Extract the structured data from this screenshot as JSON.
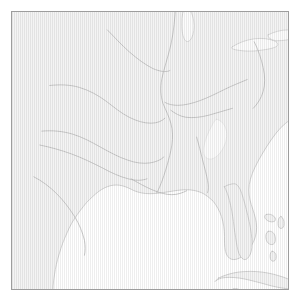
{
  "figure": {
    "kind": "reference-outline-map",
    "title": "",
    "width_px": 301,
    "height_px": 302,
    "frame": {
      "border_color": "#9d9d9d",
      "border_width_px": 1,
      "inset_left_px": 11,
      "inset_top_px": 11,
      "inner_width_px": 278,
      "inner_height_px": 279
    }
  },
  "palette": {
    "page_background": "#ffffff",
    "land_fill": "#f4f4f4",
    "land_hatch": "#969696",
    "water_fill": "#ffffff",
    "coastline_stroke": "#c9c9c9",
    "river_stroke": "#b9b9b9",
    "lake_fill": "#fcfcfc",
    "lake_stroke": "#cccccc",
    "border_stroke": "#9d9d9d"
  },
  "legend": {
    "visible": false,
    "entries": []
  },
  "axes": {
    "visible": false,
    "tick_labels": []
  },
  "labels": {
    "visible": false,
    "items": []
  },
  "map_features": {
    "region_described": "Gulf of Mexico and southeastern United States",
    "land_masses": [
      {
        "name": "north-american-mainland",
        "kind": "land",
        "fill": "#f4f4f4",
        "stroke": "#c9c9c9",
        "path": "M -10,-10 L 288,-10 L 288,104 C 280,108 272,114 266,122 C 259,131 253,141 248,150 C 243,159 240,167 239,174 C 238,181 239,188 241,194 C 243,200 245,206 246,212 C 247,219 246,226 243,232 C 240,238 236,243 232,246 C 228,249 224,250 221,249 C 218,248 216,245 215,241 C 214,236 214,231 214,226 C 214,219 213,212 211,206 C 209,200 206,195 203,191 C 199,187 195,184 191,182 C 186,180 181,179 176,179 C 170,179 164,180 158,181 C 151,182 145,183 139,183 C 133,183 128,182 123,180 C 119,178 115,176 111,175 C 107,174 103,174 99,175 C 95,176 91,178 87,181 C 83,184 79,188 75,192 C 71,197 67,202 63,208 C 59,214 56,221 53,228 C 50,235 48,242 46,249 C 44,256 43,263 42,270 C 41,278 41,286 41,294 L -10,294 Z"
      },
      {
        "name": "florida-peninsula",
        "kind": "land",
        "fill": "#f4f4f4",
        "stroke": "#c9c9c9",
        "path": "M 214,176 C 216,180 218,185 219,190 C 221,197 222,204 223,211 C 224,219 225,226 226,232 C 227,238 228,243 230,246 C 232,249 234,250 236,249 C 238,248 240,245 241,241 C 242,236 242,230 241,223 C 240,215 238,207 236,199 C 234,191 232,184 230,179 C 228,175 226,173 224,173 C 221,173 217,174 214,176 Z"
      },
      {
        "name": "cuba",
        "kind": "land",
        "fill": "#f4f4f4",
        "stroke": "#c9c9c9",
        "path": "M 208,268 C 214,265 221,263 228,262 C 236,261 244,261 252,262 C 260,263 267,265 273,267 C 279,269 283,271 286,273 C 288,275 288,277 286,278 C 283,279 278,279 272,278 C 265,277 258,275 251,273 C 243,271 236,269 229,268 C 222,267 216,267 211,268 C 208,269 206,270 205,271 C 204,272 205,271 208,268 Z"
      },
      {
        "name": "yucatan-peninsula",
        "kind": "land",
        "fill": "#f4f4f4",
        "stroke": "#c9c9c9",
        "path": "M 148,288 C 153,284 159,282 165,281 C 172,280 179,280 185,281 C 190,282 194,284 196,286 L 198,294 L 146,294 Z"
      },
      {
        "name": "bahamas-island-1",
        "kind": "land",
        "fill": "#f4f4f4",
        "stroke": "#c9c9c9",
        "path": "M 256,204 C 259,203 262,204 264,206 C 266,208 266,210 264,211 C 261,212 258,211 256,209 C 254,207 254,205 256,204 Z"
      },
      {
        "name": "bahamas-island-2",
        "kind": "land",
        "fill": "#f4f4f4",
        "stroke": "#c9c9c9",
        "path": "M 271,206 C 273,207 274,210 274,213 C 274,216 273,218 271,218 C 269,218 268,216 268,213 C 268,209 269,206 271,206 Z"
      },
      {
        "name": "bahamas-island-3",
        "kind": "land",
        "fill": "#f4f4f4",
        "stroke": "#c9c9c9",
        "path": "M 258,221 C 261,220 264,222 265,226 C 266,230 265,233 263,234 C 260,235 257,233 256,229 C 255,225 256,222 258,221 Z"
      },
      {
        "name": "bahamas-island-4",
        "kind": "land",
        "fill": "#f4f4f4",
        "stroke": "#c9c9c9",
        "path": "M 262,241 C 264,241 266,243 266,246 C 266,249 265,251 263,251 C 261,251 260,249 260,246 C 260,243 261,241 262,241 Z"
      },
      {
        "name": "small-island-gulf",
        "kind": "land",
        "fill": "#f4f4f4",
        "stroke": "#c9c9c9",
        "path": "M 223,279 C 226,278 229,279 230,281 C 231,283 229,284 226,284 C 223,284 221,282 221,281 C 221,280 222,279 223,279 Z"
      }
    ],
    "lakes": [
      {
        "name": "lake-michigan-southern-tip",
        "fill": "#fcfcfc",
        "stroke": "#cccccc",
        "path": "M 175,-6 C 179,-4 182,2 183,9 C 184,16 183,22 181,26 C 179,30 176,31 174,28 C 172,25 171,19 171,12 C 171,4 172,-2 175,-6 Z"
      },
      {
        "name": "lake-erie",
        "fill": "#fcfcfc",
        "stroke": "#cccccc",
        "path": "M 222,35 C 228,31 236,28 244,27 C 252,26 259,27 264,29 C 268,31 269,33 266,35 C 262,37 255,38 247,39 C 238,40 230,39 225,38 C 221,37 220,36 222,35 Z"
      },
      {
        "name": "lake-ontario",
        "fill": "#fcfcfc",
        "stroke": "#cccccc",
        "path": "M 258,23 C 264,20 271,18 278,18 C 284,18 288,19 290,21 C 291,23 289,25 285,26 C 280,28 273,29 266,29 C 261,28 257,26 258,23 Z"
      },
      {
        "name": "highland-light-band",
        "fill": "#fcfcfc",
        "stroke": "#e4e4e4",
        "path": "M 206,108 C 211,109 215,114 216,120 C 217,127 215,134 211,140 C 207,146 202,149 198,148 C 194,147 192,143 193,137 C 194,130 197,122 201,115 C 203,111 205,108 206,108 Z"
      }
    ],
    "rivers": [
      {
        "name": "mississippi-main-stem",
        "stroke": "#b9b9b9",
        "path": "M 165,-8 C 164,6 163,20 160,33 C 157,46 153,57 151,67 C 149,77 150,85 152,92 C 155,99 158,105 160,112 C 162,119 162,127 161,134 C 160,141 158,148 156,155 C 154,162 152,168 150,173 C 148,178 147,180 146,182"
      },
      {
        "name": "ohio-river",
        "stroke": "#b9b9b9",
        "path": "M 237,68 C 230,71 222,74 214,78 C 206,82 198,86 190,89 C 182,92 174,94 167,94 C 162,94 157,93 154,91"
      },
      {
        "name": "tennessee-river",
        "stroke": "#b9b9b9",
        "path": "M 222,97 C 214,99 206,102 198,104 C 190,106 182,107 175,106 C 169,105 164,102 160,99"
      },
      {
        "name": "missouri-river",
        "stroke": "#b9b9b9",
        "path": "M 38,74 C 48,73 58,73 68,76 C 78,79 87,84 95,90 C 103,96 110,102 118,106 C 126,110 133,112 140,112 C 146,112 151,110 154,107"
      },
      {
        "name": "arkansas-river",
        "stroke": "#b9b9b9",
        "path": "M 30,120 C 40,119 51,120 61,123 C 71,126 80,131 89,136 C 98,141 107,146 116,149 C 124,152 132,153 139,152 C 145,151 150,149 153,146"
      },
      {
        "name": "red-river",
        "stroke": "#b9b9b9",
        "path": "M 28,134 C 38,136 49,139 60,143 C 71,147 81,152 91,157 C 100,162 109,166 117,168 C 124,170 131,170 136,168"
      },
      {
        "name": "rio-grande",
        "stroke": "#b9b9b9",
        "path": "M 22,166 C 30,170 38,176 45,183 C 52,190 58,198 63,206 C 68,214 71,222 73,230 C 74,236 74,241 73,245"
      },
      {
        "name": "gulf-coast-tributary",
        "stroke": "#b9b9b9",
        "path": "M 120,168 C 127,172 134,176 141,179 C 148,182 155,184 161,184 C 167,184 172,182 176,180"
      },
      {
        "name": "alabama-river",
        "stroke": "#b9b9b9",
        "path": "M 186,126 C 188,133 190,141 192,149 C 194,157 196,164 197,170 C 198,175 198,179 197,182"
      },
      {
        "name": "northern-tributary",
        "stroke": "#b9b9b9",
        "path": "M 96,18 C 103,25 110,33 118,40 C 126,47 134,53 142,57 C 149,60 155,61 159,59"
      },
      {
        "name": "appalachian-divide",
        "stroke": "#b9b9b9",
        "path": "M 244,30 C 248,38 251,47 253,56 C 255,65 255,73 253,80 C 251,87 247,93 243,97"
      }
    ],
    "coastlines": [
      {
        "name": "gulf-of-mexico-shoreline",
        "stroke": "#c9c9c9"
      },
      {
        "name": "atlantic-shoreline",
        "stroke": "#c9c9c9"
      }
    ]
  }
}
